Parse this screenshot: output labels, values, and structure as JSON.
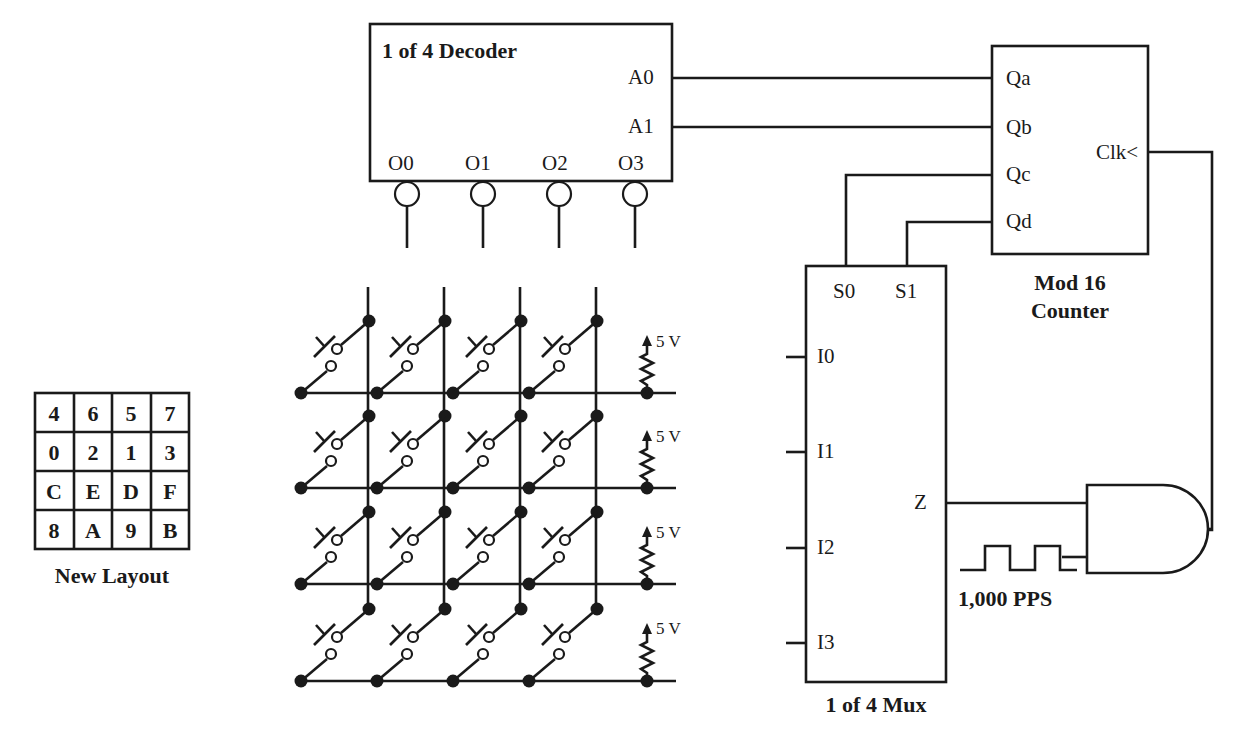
{
  "decoder": {
    "title": "1 of 4 Decoder",
    "inputs": [
      "A0",
      "A1"
    ],
    "outputs": [
      "O0",
      "O1",
      "O2",
      "O3"
    ]
  },
  "counter": {
    "title_line1": "Mod 16",
    "title_line2": "Counter",
    "outputs": [
      "Qa",
      "Qb",
      "Qc",
      "Qd"
    ],
    "clock": "Clk<"
  },
  "mux": {
    "title": "1 of 4 Mux",
    "selects": [
      "S0",
      "S1"
    ],
    "inputs": [
      "I0",
      "I1",
      "I2",
      "I3"
    ],
    "output": "Z"
  },
  "pulse_source": {
    "label": "1,000 PPS"
  },
  "keypad": {
    "pullup_labels": [
      "5 V",
      "5 V",
      "5 V",
      "5 V"
    ],
    "rows": 4,
    "cols": 4
  },
  "layout_table": {
    "caption": "New Layout",
    "rows": [
      [
        "4",
        "6",
        "5",
        "7"
      ],
      [
        "0",
        "2",
        "1",
        "3"
      ],
      [
        "C",
        "E",
        "D",
        "F"
      ],
      [
        "8",
        "A",
        "9",
        "B"
      ]
    ]
  }
}
